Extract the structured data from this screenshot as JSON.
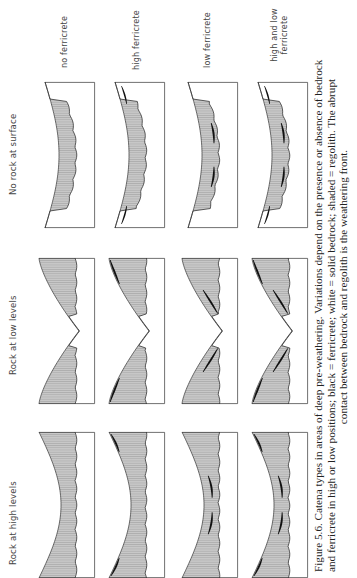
{
  "figure": {
    "orientation": "rotated 90 degrees counter-clockwise",
    "column_headers": [
      "Rock at high levels",
      "Rock at low levels",
      "No rock at surface"
    ],
    "row_labels": [
      "no ferricrete",
      "high ferricrete",
      "low ferricrete",
      "high and low\nferricrete"
    ],
    "row_label_lines": [
      [
        "no ferricrete"
      ],
      [
        "high ferricrete"
      ],
      [
        "low ferricrete"
      ],
      [
        "high and low",
        "ferricrete"
      ]
    ],
    "caption": {
      "line1": "Figure 5.6.  Catena types in areas of deep pre-weathering.  Variations depend on the presence or absence of bedrock",
      "line2": "and ferricrete in high or low positions; black = ferricrete; white = solid bedrock; shaded = regolith.  The abrupt",
      "line3": "contact between bedrock and regolith is the weathering front."
    },
    "legend": {
      "black": "ferricrete",
      "white": "solid bedrock",
      "shaded": "regolith"
    },
    "colors": {
      "regolith_fill": "#c8c8c8",
      "regolith_hatch": "#9a9a9a",
      "ferricrete": "#111111",
      "bedrock": "#ffffff",
      "outline": "#333333"
    }
  }
}
